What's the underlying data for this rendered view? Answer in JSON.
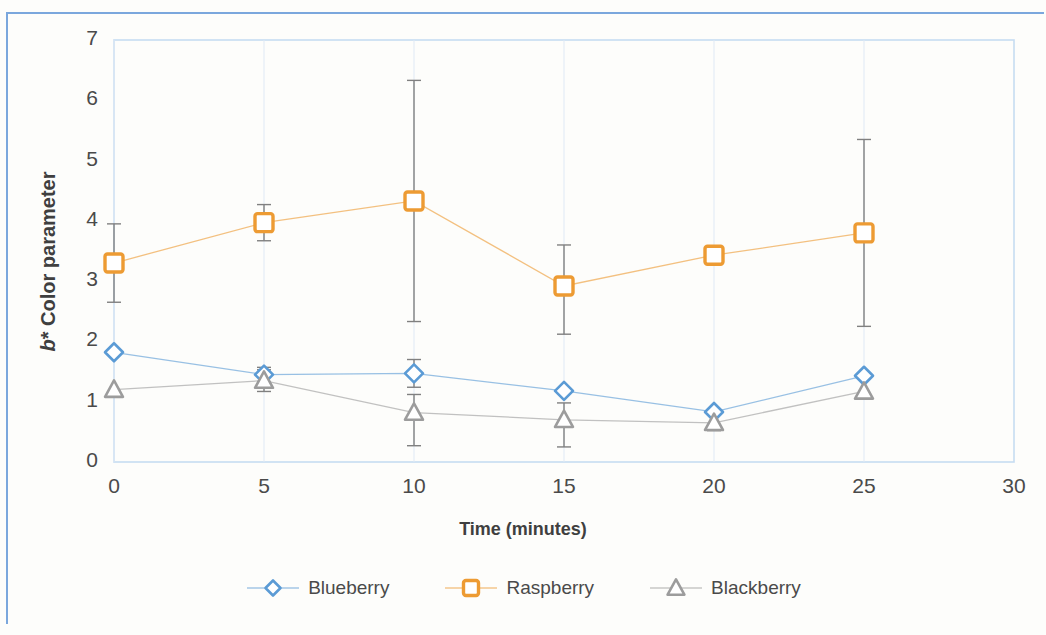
{
  "chart_data": {
    "type": "line",
    "title": "",
    "xlabel": "Time (minutes)",
    "ylabel": "b* Color parameter",
    "ylabel_italic_part": "b",
    "ylabel_rest": "* Color parameter",
    "x": [
      0,
      5,
      10,
      15,
      20,
      25
    ],
    "xlim": [
      0,
      30
    ],
    "ylim": [
      0,
      7
    ],
    "xticks": [
      "0",
      "5",
      "10",
      "15",
      "20",
      "25",
      "30"
    ],
    "yticks": [
      "0",
      "1",
      "2",
      "3",
      "4",
      "5",
      "6",
      "7"
    ],
    "grid": false,
    "legend_position": "bottom",
    "series": [
      {
        "name": "Blueberry",
        "color": "#5b9bd5",
        "marker": "diamond",
        "values": [
          1.82,
          1.45,
          1.47,
          1.18,
          0.83,
          1.43
        ],
        "error_upper": [
          0.0,
          0.12,
          0.23,
          0.0,
          0.0,
          0.0
        ],
        "error_lower": [
          0.0,
          0.12,
          0.23,
          0.0,
          0.0,
          0.0
        ]
      },
      {
        "name": "Raspberry",
        "color": "#ed9b33",
        "marker": "square",
        "values": [
          3.3,
          3.97,
          4.33,
          2.92,
          3.43,
          3.8
        ],
        "error_upper": [
          0.65,
          0.3,
          2.0,
          0.68,
          0.0,
          1.55
        ],
        "error_lower": [
          0.65,
          0.3,
          2.0,
          0.8,
          0.0,
          1.55
        ]
      },
      {
        "name": "Blackberry",
        "color": "#9c9c9c",
        "marker": "triangle",
        "values": [
          1.2,
          1.35,
          0.82,
          0.7,
          0.65,
          1.17
        ],
        "error_upper": [
          0.0,
          0.18,
          0.3,
          0.28,
          0.13,
          0.0
        ],
        "error_lower": [
          0.0,
          0.18,
          0.55,
          0.45,
          0.13,
          0.0
        ]
      }
    ]
  },
  "legend": {
    "entries": [
      {
        "label": "Blueberry"
      },
      {
        "label": "Raspberry"
      },
      {
        "label": "Blackberry"
      }
    ]
  },
  "colors": {
    "blueberry": "#5b9bd5",
    "raspberry": "#ed9b33",
    "blackberry": "#9c9c9c",
    "frame": "#7ba7dd",
    "text": "#4a4a4a"
  }
}
